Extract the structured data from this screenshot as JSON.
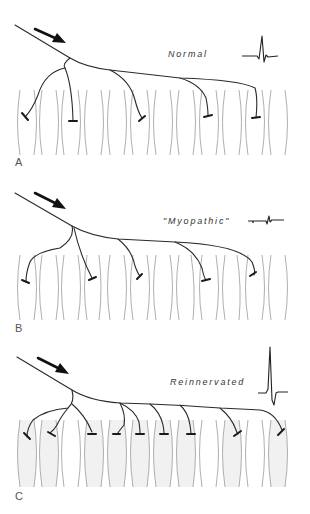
{
  "figure": {
    "panels": [
      {
        "id": "A",
        "letter": "A",
        "label": "Normal",
        "waveform": "normal-muap",
        "fiber_top": 90,
        "fiber_bottom": 155,
        "shaded": false,
        "endplate_count": 5
      },
      {
        "id": "B",
        "letter": "B",
        "label": "\"Myopathic\"",
        "waveform": "small-short-muap",
        "fiber_top": 255,
        "fiber_bottom": 320,
        "shaded": false,
        "endplate_count": 5
      },
      {
        "id": "C",
        "letter": "C",
        "label": "Reinnervated",
        "waveform": "large-muap",
        "fiber_top": 420,
        "fiber_bottom": 487,
        "shaded": true,
        "endplate_count": 10
      }
    ],
    "icons": {
      "arrow": "direction-arrow-icon",
      "nerve": "axon-branch",
      "endplate": "t-bar-endplate",
      "fiber": "muscle-fiber"
    },
    "colors": {
      "nerve": "#2a2a2a",
      "fiber_outline": "#9a9a9a",
      "fiber_fill": "#f1f1f1",
      "text": "#333333"
    }
  }
}
